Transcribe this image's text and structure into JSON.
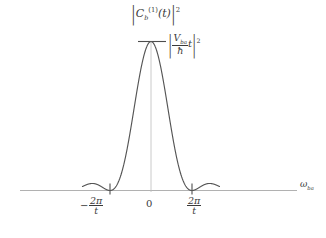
{
  "figure": {
    "colors": {
      "curve": "#555555",
      "axis": "#9a9a9a",
      "center_line": "#b0b0b0",
      "text": "#3a3a3a",
      "background": "#ffffff"
    }
  },
  "labels": {
    "y_quantity": {
      "bar_left": "|",
      "symbol": "C",
      "subscript": "b",
      "superscript_order": "(1)",
      "argument": "(t)",
      "bar_right": "|",
      "exponent": "2",
      "plain": "|C_b^(1)(t)|^2"
    },
    "peak_value": {
      "bar_left": "|",
      "numerator": "V",
      "numerator_subscript": "ba",
      "denominator": "ħ",
      "multiplier": "t",
      "bar_right": "|",
      "exponent": "2",
      "plain": "|V_ba/ħ t|^2"
    },
    "x_ticks": [
      {
        "name": "negative-two-pi-over-t",
        "sign": "−",
        "numerator": "2π",
        "denominator": "t",
        "plain": "-2π/t"
      },
      {
        "name": "zero",
        "text": "0",
        "plain": "0"
      },
      {
        "name": "positive-two-pi-over-t",
        "sign": "",
        "numerator": "2π",
        "denominator": "t",
        "plain": "2π/t"
      }
    ],
    "x_axis": {
      "symbol": "ω",
      "subscript": "ba",
      "plain": "ω_ba"
    }
  },
  "chart_data": {
    "type": "line",
    "title": "",
    "function": "sinc-squared",
    "formula": "|C_b^(1)(t)|^2 proportional to sin^2((omega_ba) t / 2) / (omega_ba/2)^2",
    "xlabel": "ω_ba",
    "ylabel": "|C_b^(1)(t)|²",
    "xlim": [
      -10.5,
      10.5
    ],
    "ylim": [
      0,
      1.02
    ],
    "xticks": [
      -6.2832,
      0,
      6.2832
    ],
    "xticklabels": [
      "-2π/t",
      "0",
      "2π/t"
    ],
    "yticks": [
      1.0
    ],
    "yticklabels": [
      "|V_ba t / ħ|²"
    ],
    "grid": false,
    "legend": false,
    "peak_value": 1.0,
    "peak_x": 0,
    "zeros": [
      -6.2832,
      6.2832
    ],
    "series": [
      {
        "name": "|C_b^(1)(t)|²",
        "x": [
          -10.5,
          -10.0,
          -9.5,
          -9.0,
          -8.5,
          -8.0,
          -7.5,
          -7.0,
          -6.6,
          -6.2832,
          -6.0,
          -5.5,
          -5.0,
          -4.5,
          -4.0,
          -3.5,
          -3.0,
          -2.5,
          -2.0,
          -1.5,
          -1.0,
          -0.5,
          0.0,
          0.5,
          1.0,
          1.5,
          2.0,
          2.5,
          3.0,
          3.5,
          4.0,
          4.5,
          5.0,
          5.5,
          6.0,
          6.2832,
          6.6,
          7.0,
          7.5,
          8.0,
          8.5,
          9.0,
          9.5,
          10.0,
          10.5
        ],
        "y": [
          0.0072,
          0.0102,
          0.0095,
          0.0056,
          0.0015,
          0.0,
          0.0019,
          0.0073,
          0.0098,
          0.0,
          0.0043,
          0.024,
          0.0573,
          0.1047,
          0.1654,
          0.2372,
          0.3166,
          0.3996,
          0.4818,
          0.5585,
          0.6259,
          0.6806,
          1.0,
          0.6806,
          0.6259,
          0.5585,
          0.4818,
          0.3996,
          0.3166,
          0.2372,
          0.1654,
          0.1047,
          0.0573,
          0.024,
          0.0043,
          0.0,
          0.0098,
          0.0073,
          0.0019,
          0.0,
          0.0015,
          0.0056,
          0.0095,
          0.0102,
          0.0072
        ]
      }
    ]
  }
}
